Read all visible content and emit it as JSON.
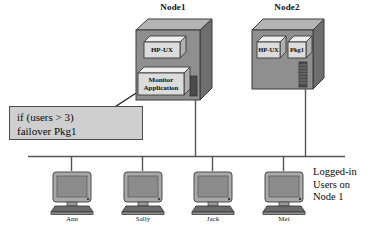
{
  "diagram": {
    "colors": {
      "cabinet_front": "#8f8f8f",
      "cabinet_top": "#b4b4b4",
      "cabinet_side": "#6e6e6e",
      "chip_face": "#dcdcdc",
      "chip_side": "#b0b0b0",
      "callout_fill": "#cfcfcf",
      "outline": "#3a3a3a",
      "wire": "#555555",
      "monitor_body": "#a8a8a8",
      "monitor_screen": "#8c8c8c"
    },
    "nodes": [
      {
        "label": "Node1",
        "chips": [
          {
            "lines": [
              "HP-UX"
            ]
          },
          {
            "lines": [
              "Monitor",
              "Application"
            ]
          }
        ]
      },
      {
        "label": "Node2",
        "chips": [
          {
            "lines": [
              "HP-UX"
            ]
          },
          {
            "lines": [
              "Pkg1"
            ]
          }
        ]
      }
    ],
    "callout": {
      "line1": "if  (users > 3)",
      "line2": "failover Pkg1"
    },
    "terminals": [
      {
        "label": "Ann"
      },
      {
        "label": "Sally"
      },
      {
        "label": "Jack"
      },
      {
        "label": "Mei"
      }
    ],
    "caption": {
      "line1": "Logged-in",
      "line2": "Users on",
      "line3": "Node 1"
    }
  }
}
